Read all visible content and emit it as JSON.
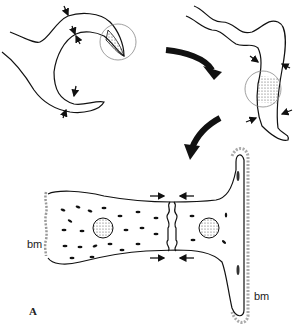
{
  "figure": {
    "panel_label": "A",
    "labels": {
      "bm_left": "bm",
      "bm_right": "bm"
    },
    "stages": [
      {
        "name": "stage-1",
        "description": "branching tubule with stippled tip region circled, arrows marking constriction points"
      },
      {
        "name": "stage-2",
        "description": "elongated wavy tubule with stippled segment circled, arrows marking constriction"
      },
      {
        "name": "stage-3",
        "description": "fused tube with central junction, nuclei, and basement membrane (bm)"
      }
    ],
    "colors": {
      "line": "#111111",
      "stipple": "#555555",
      "bm": "#9a9a9a"
    }
  }
}
